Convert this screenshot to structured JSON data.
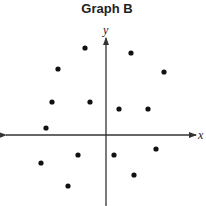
{
  "chart_data": {
    "type": "scatter",
    "title": "Graph B",
    "xlabel": "x",
    "ylabel": "y",
    "grid": false,
    "ticks": false,
    "legend": null,
    "axis_origin_px": [
      106,
      135
    ],
    "points_px": [
      {
        "x": 85,
        "y": 48
      },
      {
        "x": 131,
        "y": 53
      },
      {
        "x": 58,
        "y": 69
      },
      {
        "x": 164,
        "y": 72
      },
      {
        "x": 52,
        "y": 102
      },
      {
        "x": 90,
        "y": 102
      },
      {
        "x": 119,
        "y": 109
      },
      {
        "x": 148,
        "y": 109
      },
      {
        "x": 46,
        "y": 128
      },
      {
        "x": 156,
        "y": 149
      },
      {
        "x": 78,
        "y": 155
      },
      {
        "x": 114,
        "y": 155
      },
      {
        "x": 41,
        "y": 163
      },
      {
        "x": 134,
        "y": 175
      },
      {
        "x": 68,
        "y": 186
      }
    ],
    "points_relative_to_origin": [
      {
        "x": -21,
        "y": 87
      },
      {
        "x": 25,
        "y": 82
      },
      {
        "x": -48,
        "y": 66
      },
      {
        "x": 58,
        "y": 63
      },
      {
        "x": -54,
        "y": 33
      },
      {
        "x": -16,
        "y": 33
      },
      {
        "x": 13,
        "y": 26
      },
      {
        "x": 42,
        "y": 26
      },
      {
        "x": -60,
        "y": 7
      },
      {
        "x": 50,
        "y": -14
      },
      {
        "x": -28,
        "y": -20
      },
      {
        "x": 8,
        "y": -20
      },
      {
        "x": -65,
        "y": -28
      },
      {
        "x": 28,
        "y": -40
      },
      {
        "x": -38,
        "y": -51
      }
    ]
  },
  "colors": {
    "point": "#111111",
    "axis": "#333333",
    "text": "#222222"
  }
}
